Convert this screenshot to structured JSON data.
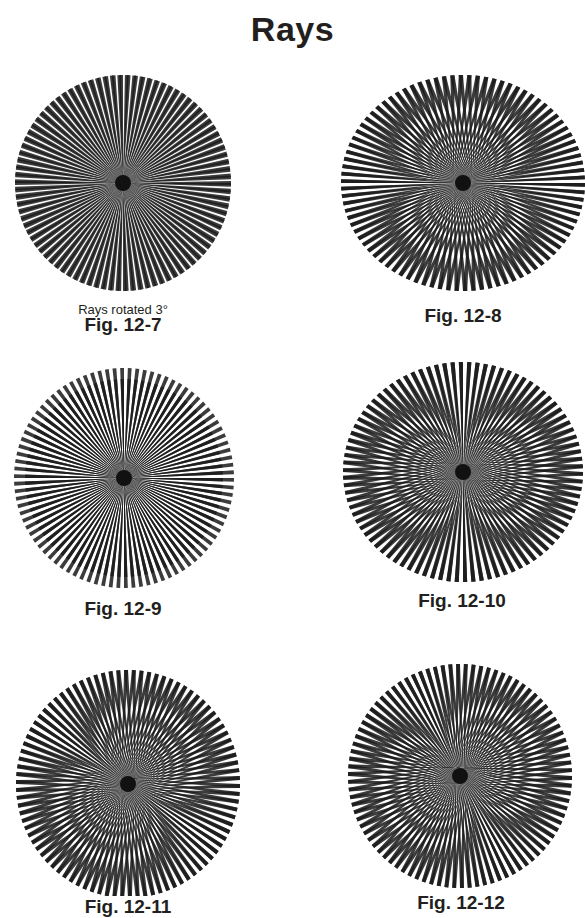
{
  "page": {
    "title": "Rays"
  },
  "figures": [
    {
      "id": "fig-12-7",
      "label": "Fig. 12-7",
      "sublabel": "Rays rotated 3°",
      "box": {
        "x": 12,
        "y": 72,
        "w": 222,
        "h": 222
      },
      "center": [
        111,
        111
      ],
      "rx": 108,
      "ry": 108,
      "spokes": 180,
      "overlays": [
        {
          "dx": 0,
          "dy": 0,
          "rot": 0
        },
        {
          "dx": 0,
          "dy": 0,
          "rot": 3
        }
      ],
      "caption_pos": {
        "sub_y": 302,
        "y": 314,
        "cx": 123
      }
    },
    {
      "id": "fig-12-8",
      "label": "Fig. 12-8",
      "box": {
        "x": 340,
        "y": 72,
        "w": 246,
        "h": 222
      },
      "center": [
        123,
        111
      ],
      "rx": 122,
      "ry": 108,
      "spokes": 180,
      "overlays": [
        {
          "dx": -9,
          "dy": 0,
          "rot": 0
        },
        {
          "dx": 9,
          "dy": 0,
          "rot": 0
        }
      ],
      "caption_pos": {
        "y": 305,
        "cx": 463
      }
    },
    {
      "id": "fig-12-9",
      "label": "Fig. 12-9",
      "box": {
        "x": 12,
        "y": 366,
        "w": 224,
        "h": 226
      },
      "center": [
        112,
        112
      ],
      "rx": 110,
      "ry": 110,
      "spokes": 180,
      "overlays": [
        {
          "dx": 0,
          "dy": 0,
          "rot": 0
        },
        {
          "dx": 0,
          "dy": 0,
          "rot": 0,
          "scale": 0.9
        }
      ],
      "caption_pos": {
        "y": 598,
        "cx": 123
      }
    },
    {
      "id": "fig-12-10",
      "label": "Fig. 12-10",
      "box": {
        "x": 340,
        "y": 360,
        "w": 246,
        "h": 226
      },
      "center": [
        123,
        112
      ],
      "rx": 120,
      "ry": 110,
      "spokes": 180,
      "overlays": [
        {
          "dx": 0,
          "dy": -8,
          "rot": 0
        },
        {
          "dx": 0,
          "dy": 8,
          "rot": 0
        }
      ],
      "caption_pos": {
        "y": 590,
        "cx": 462
      }
    },
    {
      "id": "fig-12-11",
      "label": "Fig. 12-11",
      "box": {
        "x": 14,
        "y": 662,
        "w": 230,
        "h": 234
      },
      "center": [
        114,
        122
      ],
      "rx": 112,
      "ry": 114,
      "spokes": 180,
      "overlays": [
        {
          "dx": -7,
          "dy": -5,
          "rot": 0
        },
        {
          "dx": 7,
          "dy": 5,
          "rot": 0
        }
      ],
      "caption_pos": {
        "y": 896,
        "cx": 128
      }
    },
    {
      "id": "fig-12-12",
      "label": "Fig. 12-12",
      "box": {
        "x": 344,
        "y": 660,
        "w": 230,
        "h": 230
      },
      "center": [
        116,
        116
      ],
      "rx": 112,
      "ry": 112,
      "spokes": 180,
      "overlays": [
        {
          "dx": -4,
          "dy": -8,
          "rot": 0
        },
        {
          "dx": 4,
          "dy": 8,
          "rot": 0
        }
      ],
      "caption_pos": {
        "y": 892,
        "cx": 461
      }
    }
  ],
  "colors": {
    "ink": "#1a1a1a",
    "background": "#ffffff",
    "text": "#231f20"
  }
}
